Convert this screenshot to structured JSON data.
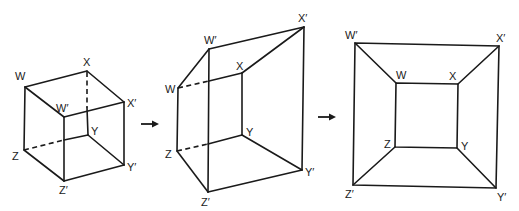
{
  "figures": [
    {
      "name": "cube",
      "labels": {
        "W": "W",
        "X": "X",
        "Y": "Y",
        "Z": "Z",
        "Wp": "W′",
        "Xp": "X′",
        "Yp": "Y′",
        "Zp": "Z′"
      }
    },
    {
      "name": "perspective-frustum",
      "labels": {
        "W": "W",
        "X": "X",
        "Y": "Y",
        "Z": "Z",
        "Wp": "W′",
        "Xp": "X′",
        "Yp": "Y′",
        "Zp": "Z′"
      }
    },
    {
      "name": "flattened-square-in-square",
      "labels": {
        "W": "W",
        "X": "X",
        "Y": "Y",
        "Z": "Z",
        "Wp": "W′",
        "Xp": "X′",
        "Yp": "Y′",
        "Zp": "Z′"
      }
    }
  ],
  "arrows": [
    {
      "name": "arrow-1",
      "direction": "right"
    },
    {
      "name": "arrow-2",
      "direction": "right"
    }
  ],
  "colors": {
    "line": "#1a1a1a",
    "background": "#ffffff"
  }
}
